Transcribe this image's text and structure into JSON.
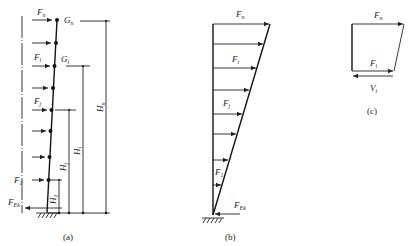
{
  "figure": {
    "panels": [
      {
        "id": "a",
        "caption": "(a)",
        "labels": {
          "Fn": "F",
          "Fn_sub": "n",
          "Gn": "G",
          "Gn_sub": "n",
          "Fi": "F",
          "Fi_sub": "i",
          "Gi": "G",
          "Gi_sub": "i",
          "Fj": "F",
          "Fj_sub": "j",
          "F1": "F",
          "F1_sub": "1",
          "FEk": "F",
          "FEk_sub": "Ek",
          "Hn": "H",
          "Hn_sub": "n",
          "Hi": "H",
          "Hi_sub": "i",
          "Hj": "H",
          "Hj_sub": "j",
          "H1": "H",
          "H1_sub": "1"
        }
      },
      {
        "id": "b",
        "caption": "(b)",
        "labels": {
          "Fn": "F",
          "Fn_sub": "n",
          "Fi": "F",
          "Fi_sub": "i",
          "Fj": "F",
          "Fj_sub": "j",
          "F1": "F",
          "F1_sub": "1",
          "FEk": "F",
          "FEk_sub": "Ek"
        }
      },
      {
        "id": "c",
        "caption": "(c)",
        "labels": {
          "Fn": "F",
          "Fn_sub": "n",
          "Fi": "F",
          "Fi_sub": "i",
          "Vi": "V",
          "Vi_sub": "i"
        }
      }
    ]
  }
}
